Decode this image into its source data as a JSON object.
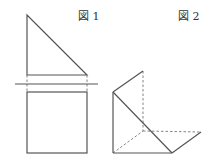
{
  "figures": [
    {
      "id": "fig1",
      "label": "図 1",
      "description": "Orthographic views: right triangle (elevation) above a square (plan), separated by a horizontal ground line"
    },
    {
      "id": "fig2",
      "label": "図 2",
      "description": "Isometric view of a triangular prism shape with hidden edges drawn dashed"
    }
  ],
  "colors": {
    "line": "#555555",
    "hidden_line": "#777777",
    "text": "#333333",
    "background": "#ffffff"
  }
}
